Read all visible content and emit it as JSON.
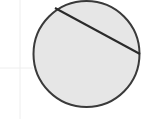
{
  "diagram": {
    "type": "circle-with-chord",
    "circle": {
      "cx": 86.5,
      "cy": 54,
      "r": 53,
      "fill": "#e6e6e6",
      "stroke": "#3a3a3a",
      "stroke_width": 2
    },
    "chord": {
      "x1": 55,
      "y1": 8,
      "x2": 140,
      "y2": 54,
      "stroke": "#2a2a2a",
      "stroke_width": 2
    },
    "guides": [
      {
        "x1": 20,
        "y1": 0,
        "x2": 20,
        "y2": 119,
        "stroke": "#eeeeee"
      },
      {
        "x1": 0,
        "y1": 68,
        "x2": 33,
        "y2": 68,
        "stroke": "#eeeeee"
      }
    ]
  }
}
